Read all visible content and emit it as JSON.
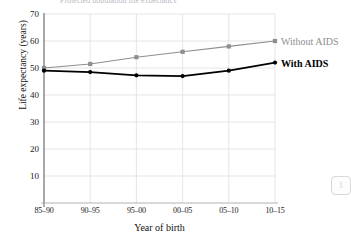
{
  "figure": {
    "clipped_title": "Projected population life expectancy",
    "corner_badge": "1"
  },
  "chart_data": {
    "type": "line",
    "title": "",
    "xlabel": "Year of birth",
    "ylabel": "Life expectancy (years)",
    "categories": [
      "85–90",
      "90–95",
      "95–00",
      "00–05",
      "05–10",
      "10–15"
    ],
    "ylim": [
      0,
      70
    ],
    "yticks": [
      10,
      20,
      30,
      40,
      50,
      60,
      70
    ],
    "ytick_labels": [
      "10",
      "20",
      "30",
      "40",
      "50",
      "60",
      "70"
    ],
    "grid": true,
    "legend_position": "right-of-line-ends",
    "series": [
      {
        "name": "Without AIDS",
        "color": "#8e8e8e",
        "marker": "square",
        "values": [
          50,
          51.5,
          54,
          56,
          58,
          60
        ]
      },
      {
        "name": "With AIDS",
        "color": "#000000",
        "marker": "circle",
        "values": [
          49,
          48.5,
          47.3,
          47,
          49,
          52
        ]
      }
    ]
  }
}
